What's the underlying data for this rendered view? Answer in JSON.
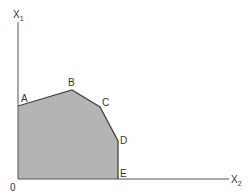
{
  "diagram": {
    "type": "feasible-region",
    "axes": {
      "vertical_label": "X",
      "vertical_sub": "1",
      "horizontal_label": "X",
      "horizontal_sub": "2",
      "origin_label": "0"
    },
    "vertices": [
      {
        "label": "A",
        "x": 18,
        "y": 106
      },
      {
        "label": "B",
        "x": 72,
        "y": 90
      },
      {
        "label": "C",
        "x": 100,
        "y": 107
      },
      {
        "label": "D",
        "x": 118,
        "y": 141
      },
      {
        "label": "E",
        "x": 118,
        "y": 179
      }
    ],
    "colors": {
      "region_fill": "#b4b4b4",
      "lines": "#444444",
      "axis": "#555555",
      "text": "#333333"
    }
  }
}
